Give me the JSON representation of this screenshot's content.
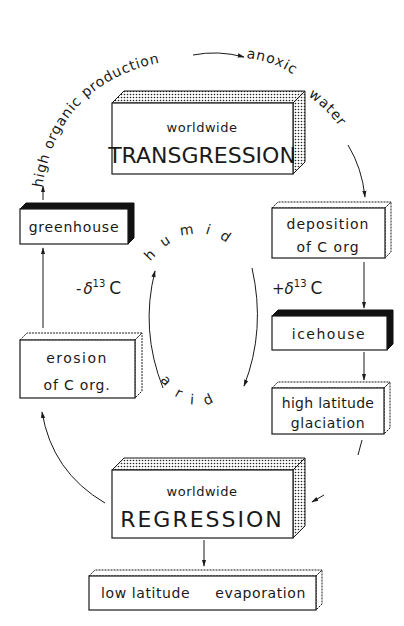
{
  "diagram": {
    "boxes": {
      "transgression": {
        "line1": "worldwide",
        "line2": "TRANSGRESSION",
        "style": "stippled"
      },
      "greenhouse": {
        "line1": "greenhouse",
        "style": "black"
      },
      "deposition": {
        "line1": "deposition",
        "line2": "of C org",
        "style": "plain"
      },
      "icehouse": {
        "line1": "icehouse",
        "style": "black"
      },
      "glaciation": {
        "line1": "high latitude",
        "line2": "glaciation",
        "style": "plain"
      },
      "erosion": {
        "line1": "erosion",
        "line2": "of C org.",
        "style": "plain"
      },
      "regression": {
        "line1": "worldwide",
        "line2": "REGRESSION",
        "style": "stippled"
      },
      "evaporation": {
        "line1": "low latitude",
        "line2": "evaporation",
        "style": "plain"
      }
    },
    "arc_labels": {
      "high_organic_production": "high organic production",
      "anoxic": "anoxic",
      "water": "water",
      "humid": "humid",
      "arid": "arid"
    },
    "isotope_labels": {
      "negative": {
        "sign": "-",
        "delta": "δ",
        "mass": "13",
        "element": "C"
      },
      "positive": {
        "sign": "+",
        "delta": "δ",
        "mass": "13",
        "element": "C"
      }
    }
  }
}
